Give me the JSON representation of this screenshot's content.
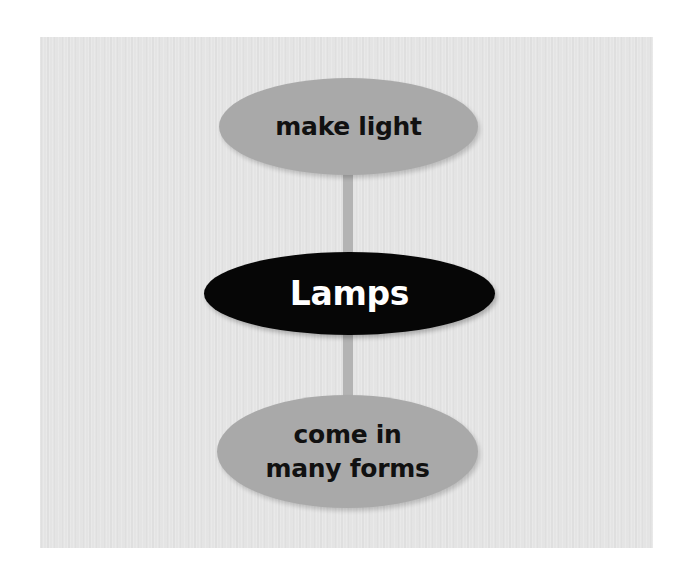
{
  "diagram": {
    "type": "concept-map",
    "center": {
      "label": "Lamps",
      "fill": "#060606",
      "text_color": "#ffffff"
    },
    "nodes": [
      {
        "position": "top",
        "label": "make light",
        "fill": "#a9a9a9",
        "text_color": "#111111"
      },
      {
        "position": "bottom",
        "label": "come in\nmany forms",
        "fill": "#a9a9a9",
        "text_color": "#111111"
      }
    ],
    "edges": [
      {
        "from": "Lamps",
        "to": "make light"
      },
      {
        "from": "Lamps",
        "to": "come in many forms"
      }
    ],
    "colors": {
      "panel_background": "#e4e4e4",
      "connector": "#b3b3b3"
    }
  }
}
